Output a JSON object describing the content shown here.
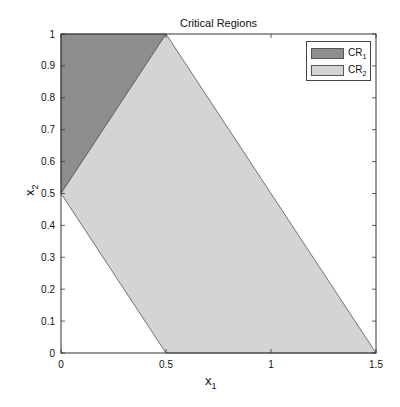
{
  "chart_data": {
    "type": "area",
    "title": "Critical Regions",
    "xlabel": "x_1",
    "ylabel": "x_2",
    "xlim": [
      0,
      1.5
    ],
    "ylim": [
      0,
      1
    ],
    "xticks": [
      0,
      0.5,
      1,
      1.5
    ],
    "xtick_labels": [
      "0",
      "0.5",
      "1",
      "1.5"
    ],
    "yticks": [
      0,
      0.1,
      0.2,
      0.3,
      0.4,
      0.5,
      0.6,
      0.7,
      0.8,
      0.9,
      1
    ],
    "ytick_labels": [
      "0",
      "0.1",
      "0.2",
      "0.3",
      "0.4",
      "0.5",
      "0.6",
      "0.7",
      "0.8",
      "0.9",
      "1"
    ],
    "grid": false,
    "legend_position": "upper right",
    "series": [
      {
        "name": "CR1",
        "label_main": "CR",
        "label_sub": "1",
        "color": "#8e8e8e",
        "polygon": [
          [
            0,
            0.5
          ],
          [
            0,
            1
          ],
          [
            0.5,
            1
          ]
        ]
      },
      {
        "name": "CR2",
        "label_main": "CR",
        "label_sub": "2",
        "color": "#d4d4d4",
        "polygon": [
          [
            0.5,
            1
          ],
          [
            1.5,
            0
          ],
          [
            0.5,
            0
          ],
          [
            0,
            0.5
          ]
        ]
      }
    ]
  },
  "axes": {
    "x_label_main": "x",
    "x_label_sub": "1",
    "y_label_main": "x",
    "y_label_sub": "2"
  }
}
